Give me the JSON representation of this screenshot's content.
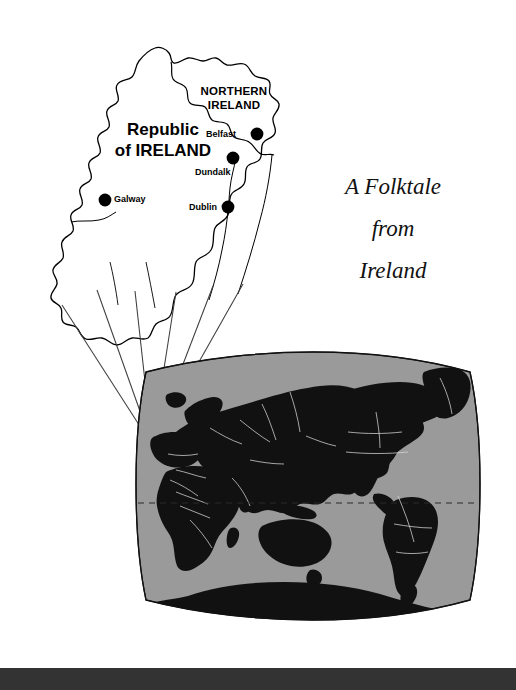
{
  "page": {
    "width": 516,
    "height": 690,
    "background": "#ffffff"
  },
  "title": {
    "text": "The Devil and...",
    "note": "cropped at top edge"
  },
  "subtitle": {
    "line1": "A Folktale",
    "line2": "from",
    "line3": "Ireland"
  },
  "ireland_map": {
    "name": "ireland-inset-map",
    "regions": [
      {
        "id": "northern-ireland",
        "label": "NORTHERN\nIRELAND",
        "line1": "NORTHERN",
        "line2": "IRELAND"
      },
      {
        "id": "republic-of-ireland",
        "label": "Republic of IRELAND",
        "line1": "Republic",
        "line2": "of IRELAND"
      }
    ],
    "cities": [
      {
        "name": "Belfast",
        "label": "Belfast",
        "dot": {
          "x": 257,
          "y": 134
        },
        "label_side": "left"
      },
      {
        "name": "Dundalk",
        "label": "Dundalk",
        "dot": {
          "x": 233,
          "y": 158
        },
        "label_side": "below"
      },
      {
        "name": "Dublin",
        "label": "Dublin",
        "dot": {
          "x": 228,
          "y": 207
        },
        "label_side": "left"
      },
      {
        "name": "Galway",
        "label": "Galway",
        "dot": {
          "x": 105,
          "y": 200
        },
        "label_side": "right"
      }
    ],
    "outline_color": "#000000",
    "fill_color": "#ffffff"
  },
  "globe": {
    "name": "world-locator-map",
    "projection": "lens",
    "ocean_color": "#9a9a9a",
    "land_color": "#111111",
    "border_color": "#d8d8d8",
    "outline_color": "#000000",
    "equator": {
      "label": "equator",
      "style": "dashed"
    },
    "callout": {
      "target": {
        "x": 152,
        "y": 445
      },
      "label": "Ireland location on world map",
      "line_count": 6
    }
  },
  "bottom_bar": {
    "name": "footer-rule",
    "color": "#333333"
  },
  "colors": {
    "paper": "#ffffff",
    "ink": "#000000",
    "ocean_gray": "#9a9a9a",
    "land_black": "#111111",
    "footer_gray": "#333333"
  }
}
